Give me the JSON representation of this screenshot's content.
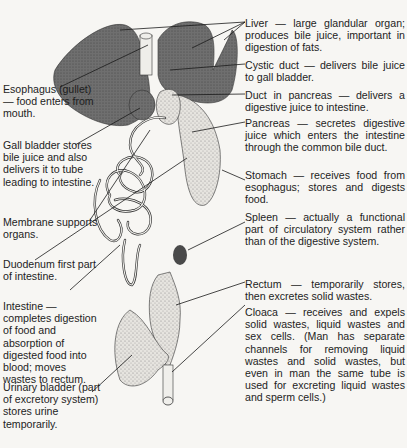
{
  "diagram": {
    "right_labels": [
      {
        "id": "liver",
        "text": "Liver — large glandular organ; produces bile juice, important in digestion of fats."
      },
      {
        "id": "cystic-duct",
        "text": "Cystic duct — delivers bile juice to gall bladder."
      },
      {
        "id": "duct-in-pancreas",
        "text": "Duct in pancreas — delivers a digestive juice to intestine."
      },
      {
        "id": "pancreas",
        "text": "Pancreas — secretes digestive juice which enters the intestine through the common bile duct."
      },
      {
        "id": "stomach",
        "text": "Stomach — receives food from esophagus; stores and digests food."
      },
      {
        "id": "spleen",
        "text": "Spleen — actually a functional part of circulatory system rather than of the digestive system."
      },
      {
        "id": "rectum",
        "text": "Rectum — temporarily stores, then excretes solid wastes."
      },
      {
        "id": "cloaca",
        "text": "Cloaca — receives and expels solid wastes, liquid wastes and sex cells. (Man has separate channels for removing liquid wastes and solid wastes, but even in man the same tube is used for excreting liquid wastes and sperm cells.)"
      }
    ],
    "left_labels": [
      {
        "id": "esophagus",
        "text": "Esophagus (gullet) — food enters from mouth."
      },
      {
        "id": "gall-bladder",
        "text": "Gall bladder stores bile juice and also delivers it to tube leading to intestine."
      },
      {
        "id": "membrane",
        "text": "Membrane supports organs."
      },
      {
        "id": "duodenum",
        "text": "Duodenum first part of intestine."
      },
      {
        "id": "intestine",
        "text": "Intestine — completes digestion of food and absorption of digested food into blood; moves wastes to rectum."
      },
      {
        "id": "urinary-bladder",
        "text": "Urinary bladder (part of excretory system) stores urine temporarily."
      }
    ],
    "colors": {
      "organ_dark": "#6b6b6b",
      "organ_light": "#e4e2dd",
      "line": "#1a1a1a",
      "background": "#f7f6f3"
    }
  }
}
